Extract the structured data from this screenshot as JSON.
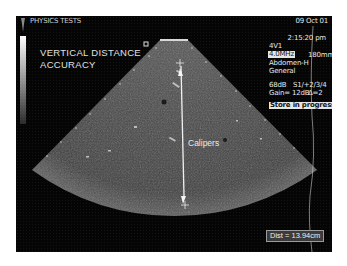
{
  "header": {
    "app_label": "PHYSICS TESTS",
    "date": "09 Oct 01",
    "time": "2:15:20 pm"
  },
  "overlay": {
    "title_line1": "VERTICAL DISTANCE",
    "title_line2": "ACCURACY",
    "annotation": "Calipers"
  },
  "settings": {
    "probe": "4V1",
    "frequency": "4.0MHz",
    "depth": "180mm",
    "preset": "Abdomen-H",
    "mode": "General",
    "dynamic_range": "68dB",
    "processing": "S1/+2/3/4",
    "gain": "Gain= 12dB",
    "delta": "Δ=2"
  },
  "status": {
    "store": "Store in progress"
  },
  "measurement": {
    "distance": "Dist = 13.94cm",
    "caliper_top": {
      "x": 164,
      "y": 47
    },
    "caliper_bottom": {
      "x": 169,
      "y": 189
    }
  },
  "colors": {
    "background": "#050505",
    "text": "#e8e8e8",
    "sector_fill": "#4a4a4a",
    "caliper_line": "#f0f0f0"
  },
  "icons": {
    "probe": "probe-icon",
    "orientation": "orientation-marker-icon",
    "caliper": "crosshair-icon"
  }
}
